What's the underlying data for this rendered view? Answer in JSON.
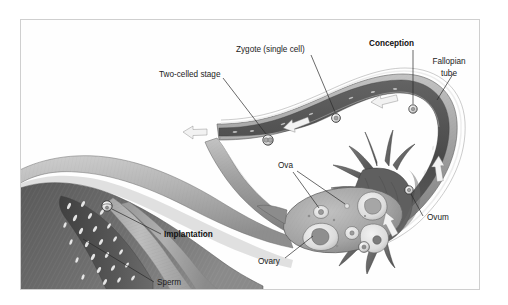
{
  "figure": {
    "domain": "medical-illustration",
    "background_color": "#ffffff",
    "frame_border_color": "#cfcfcf"
  },
  "palette": {
    "page_background": "#ffffff",
    "frame_border": "#cfcfcf",
    "uterus_light": "#b9b9b9",
    "uterus_mid": "#8d8d8d",
    "uterus_dark": "#5d5d5d",
    "endometrium_dark": "#4a4a4a",
    "tube_wall_light": "#c8c8c8",
    "tube_wall_mid": "#9a9a9a",
    "tube_lumen_dark": "#4f4f4f",
    "ovary_fill": "#a8a8a8",
    "follicle_fill": "#e6e6e6",
    "fimbriae": "#6f6f6f",
    "cell_fill": "#efefef",
    "arrow_white": "#f4f4f4",
    "sperm_white": "#f2f2f2",
    "label_text": "#1b1b1b",
    "leader_line": "#2a2a2a"
  },
  "labels": [
    {
      "id": "two-celled-stage",
      "text": "Two-celled stage",
      "bold": false,
      "text_x": 158,
      "text_y": 73,
      "anchor": "start",
      "leader": [
        [
          222,
          78
        ],
        [
          245,
          117
        ]
      ]
    },
    {
      "id": "zygote-single-cell",
      "text": "Zygote (single cell)",
      "bold": false,
      "text_x": 235,
      "text_y": 48,
      "anchor": "start",
      "leader": [
        [
          292,
          53
        ],
        [
          313,
          95
        ]
      ]
    },
    {
      "id": "conception",
      "text": "Conception",
      "bold": true,
      "text_x": 368,
      "text_y": 42,
      "anchor": "start",
      "leader": [
        [
          392,
          47
        ],
        [
          392,
          86
        ]
      ]
    },
    {
      "id": "fallopian-tube",
      "text": "Fallopian",
      "text_line2": "tube",
      "bold": false,
      "text_x": 446,
      "text_y": 66,
      "anchor": "middle",
      "leader": [
        [
          438,
          84
        ],
        [
          425,
          105
        ]
      ]
    },
    {
      "id": "ova",
      "text": "Ova",
      "bold": false,
      "text_x": 278,
      "text_y": 163,
      "anchor": "start",
      "leader": [
        [
          285,
          168
        ],
        [
          300,
          191
        ]
      ],
      "leader2": [
        [
          288,
          168
        ],
        [
          325,
          186
        ]
      ]
    },
    {
      "id": "ovary",
      "text": "Ovary",
      "bold": false,
      "text_x": 258,
      "text_y": 254,
      "anchor": "start",
      "leader": [
        [
          283,
          247
        ],
        [
          297,
          222
        ]
      ]
    },
    {
      "id": "ovum",
      "text": "Ovum",
      "bold": false,
      "text_x": 423,
      "text_y": 211,
      "anchor": "start",
      "leader": [
        [
          420,
          206
        ],
        [
          391,
          173
        ]
      ]
    },
    {
      "id": "implantation",
      "text": "Implantation",
      "bold": true,
      "text_x": 163,
      "text_y": 231,
      "anchor": "start",
      "leader": [
        [
          160,
          228
        ],
        [
          106,
          205
        ]
      ]
    },
    {
      "id": "sperm",
      "text": "Sperm",
      "bold": false,
      "text_x": 155,
      "text_y": 281,
      "anchor": "start",
      "leader": [
        [
          152,
          277
        ],
        [
          82,
          240
        ]
      ]
    }
  ],
  "structures": {
    "uterus": "uterus body with muscular wall and endometrial lining",
    "fallopian_tube": "curved tube running right then hooking down",
    "ovary": "oval organ containing follicles and ova",
    "fimbriae": "finger-like projections at the tube's distal end"
  },
  "cells": [
    {
      "id": "cell-two-celled",
      "cx": 247,
      "cy": 120,
      "r": 5.2,
      "type": "two-cell"
    },
    {
      "id": "cell-zygote",
      "cx": 315,
      "cy": 98,
      "r": 4.4,
      "type": "zygote"
    },
    {
      "id": "cell-conception",
      "cx": 392,
      "cy": 89,
      "r": 4.2,
      "type": "conception"
    },
    {
      "id": "cell-ovum-tube",
      "cx": 388,
      "cy": 170,
      "r": 4.2,
      "type": "ovum"
    },
    {
      "id": "cell-ovum-released",
      "cx": 343,
      "cy": 227,
      "r": 5.4,
      "type": "released-ovum"
    }
  ],
  "flow_arrows": [
    {
      "id": "arrow-tube-left-1",
      "x": 175,
      "y": 122,
      "dir": "left"
    },
    {
      "id": "arrow-tube-left-2",
      "x": 278,
      "y": 106,
      "dir": "left"
    },
    {
      "id": "arrow-tube-left-3",
      "x": 365,
      "y": 83,
      "dir": "left"
    },
    {
      "id": "arrow-tube-up-1",
      "x": 415,
      "y": 146,
      "dir": "up-right"
    },
    {
      "id": "arrow-fimbriae-up",
      "x": 368,
      "y": 205,
      "dir": "up-right"
    }
  ],
  "follicles": [
    {
      "cx": 300,
      "cy": 192,
      "rx": 7.5,
      "ry": 6.5,
      "kind": "small-ovum"
    },
    {
      "cx": 325,
      "cy": 186,
      "rx": 2.4,
      "ry": 2.2,
      "kind": "tiny-ovum"
    },
    {
      "cx": 348,
      "cy": 186,
      "rx": 12,
      "ry": 10,
      "kind": "corpus-luteum"
    },
    {
      "cx": 298,
      "cy": 216,
      "rx": 14,
      "ry": 10,
      "kind": "corpus-luteum"
    },
    {
      "cx": 331,
      "cy": 213,
      "rx": 7,
      "ry": 6.5,
      "kind": "mid-follicle"
    },
    {
      "cx": 353,
      "cy": 214,
      "rx": 10,
      "ry": 9,
      "kind": "mature-follicle"
    }
  ]
}
